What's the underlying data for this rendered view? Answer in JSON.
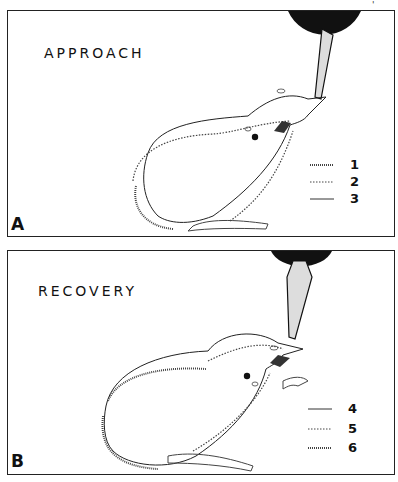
{
  "figure": {
    "corner_mark": "'",
    "panels": [
      {
        "id": "A",
        "label": "A",
        "title": "APPROACH",
        "legend": [
          {
            "number": "1",
            "line_style": "hatched"
          },
          {
            "number": "2",
            "line_style": "dotted"
          },
          {
            "number": "3",
            "line_style": "solid"
          }
        ]
      },
      {
        "id": "B",
        "label": "B",
        "title": "RECOVERY",
        "legend": [
          {
            "number": "4",
            "line_style": "solid"
          },
          {
            "number": "5",
            "line_style": "dotted"
          },
          {
            "number": "6",
            "line_style": "hatched"
          }
        ]
      }
    ],
    "colors": {
      "ink": "#111111",
      "background": "#ffffff",
      "stipple": "#bbbbbb"
    }
  }
}
